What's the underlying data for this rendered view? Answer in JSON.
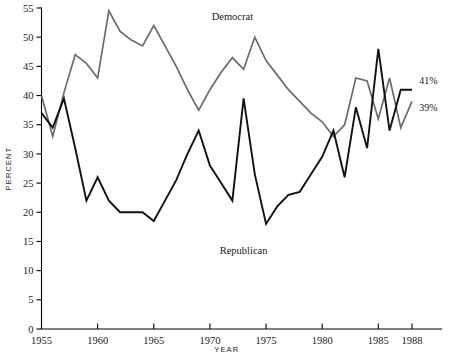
{
  "chart_data": {
    "type": "line",
    "title": "",
    "xlabel": "YEAR",
    "ylabel": "PERCENT",
    "xlim": [
      1955,
      1988
    ],
    "ylim": [
      0,
      55
    ],
    "ytick_step": 5,
    "grid": false,
    "legend": "inline-annotations",
    "xticks": [
      1955,
      1960,
      1965,
      1970,
      1975,
      1980,
      1985,
      1988
    ],
    "xticklabels": [
      "1955",
      "1960",
      "1965",
      "1970",
      "1975",
      "1980",
      "1985",
      "1988"
    ],
    "yticks": [
      0,
      5,
      10,
      15,
      20,
      25,
      30,
      35,
      40,
      45,
      50,
      55
    ],
    "yticklabels": [
      "0",
      "5",
      "10",
      "15",
      "20",
      "25",
      "30",
      "35",
      "40",
      "45",
      "50",
      "55"
    ],
    "x": [
      1955,
      1956,
      1957,
      1958,
      1959,
      1960,
      1961,
      1962,
      1963,
      1964,
      1965,
      1966,
      1967,
      1968,
      1969,
      1970,
      1971,
      1972,
      1973,
      1974,
      1975,
      1976,
      1977,
      1978,
      1979,
      1980,
      1981,
      1982,
      1983,
      1984,
      1985,
      1986,
      1987,
      1988
    ],
    "series": [
      {
        "name": "Democrat",
        "color": "#6b6b6b",
        "label_annotation": "Democrat",
        "end_value_label": "39%",
        "values": [
          40,
          33,
          40.5,
          47,
          45.5,
          43,
          54.5,
          51,
          49.5,
          48.5,
          52,
          48.5,
          45,
          41,
          37.5,
          41,
          44,
          46.5,
          44.5,
          50,
          46,
          43.5,
          41,
          39,
          37,
          35.5,
          33,
          35,
          43,
          42.5,
          36,
          43,
          34.5,
          39
        ]
      },
      {
        "name": "Republican",
        "color": "#111111",
        "label_annotation": "Republican",
        "end_value_label": "41%",
        "values": [
          37,
          34.5,
          39.5,
          31,
          22,
          26,
          22,
          20,
          20,
          20,
          18.5,
          22,
          25.5,
          30,
          34,
          28,
          25,
          22,
          39.5,
          26.5,
          18,
          21,
          23,
          23.5,
          26.5,
          29.5,
          34,
          26,
          38,
          31,
          48,
          34,
          41,
          41
        ]
      }
    ],
    "annotations": [
      {
        "text": "Democrat",
        "x": 1972,
        "y": 53.5
      },
      {
        "text": "Republican",
        "x": 1973,
        "y": 13.5
      },
      {
        "text": "41%",
        "x": 1989,
        "y": 42.5
      },
      {
        "text": "39%",
        "x": 1989,
        "y": 38.0
      }
    ]
  }
}
